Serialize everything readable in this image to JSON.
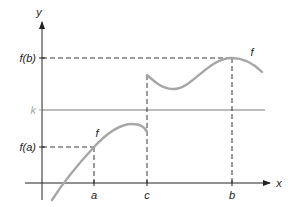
{
  "diagram": {
    "type": "function-graph",
    "axes": {
      "x_label": "x",
      "y_label": "y"
    },
    "x_ticks": [
      {
        "label": "a",
        "x": 94
      },
      {
        "label": "c",
        "x": 147
      },
      {
        "label": "b",
        "x": 232
      }
    ],
    "y_ticks": [
      {
        "label": "f(b)",
        "y": 58
      },
      {
        "label": "k",
        "y": 110
      },
      {
        "label": "f(a)",
        "y": 147
      }
    ],
    "curve_labels": [
      {
        "label": "f",
        "x": 97,
        "y": 136
      },
      {
        "label": "f",
        "x": 252,
        "y": 55
      }
    ],
    "horizontal_line": {
      "label": "k",
      "color": "#a6a6a6"
    },
    "colors": {
      "axis": "#222222",
      "curve": "#a6a6a6",
      "k_line": "#a6a6a6",
      "dashed": "#222222"
    }
  }
}
